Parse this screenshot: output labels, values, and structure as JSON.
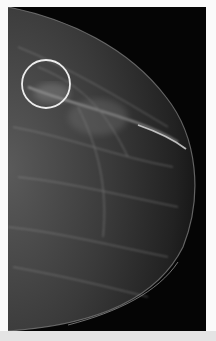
{
  "image": {
    "subject": "mammogram",
    "view": "craniocaudal breast x-ray",
    "background_color": "#050505",
    "annotation": {
      "shape": "circle",
      "color": "#e8e8e8",
      "center_x": 46,
      "center_y": 84,
      "radius": 24
    }
  }
}
